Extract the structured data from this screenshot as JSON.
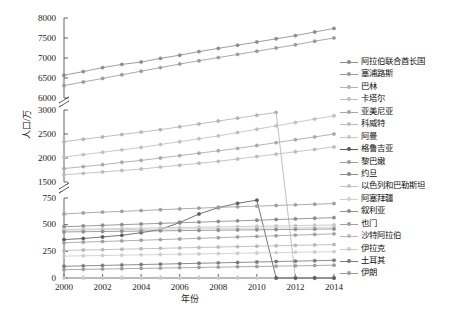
{
  "chart_data": {
    "type": "line",
    "title": "",
    "xlabel": "年份",
    "ylabel": "人口/万",
    "x": [
      2000,
      2001,
      2002,
      2003,
      2004,
      2005,
      2006,
      2007,
      2008,
      2009,
      2010,
      2011,
      2012,
      2013,
      2014
    ],
    "x_tick_labels": [
      "2000",
      "2002",
      "2004",
      "2006",
      "2008",
      "2010",
      "2012",
      "2014"
    ],
    "y_tick_labels": [
      "8000",
      "7500",
      "7000",
      "6500",
      "6000",
      "3000",
      "2500",
      "2000",
      "1500",
      "750",
      "500",
      "250",
      "0"
    ],
    "y_axis_breaks": [
      6000,
      1500
    ],
    "grid": false,
    "legend_position": "right",
    "series": [
      {
        "name": "阿拉伯联合酋长国",
        "color": "#8c8c8c",
        "values": [
          6570,
          6660,
          6760,
          6840,
          6900,
          6990,
          7070,
          7160,
          7240,
          7320,
          7400,
          7480,
          7560,
          7650,
          7740
        ]
      },
      {
        "name": "塞浦路斯",
        "color": "#9a9a9a",
        "values": [
          6310,
          6400,
          6490,
          6580,
          6670,
          6760,
          6850,
          6930,
          7010,
          7090,
          7170,
          7250,
          7330,
          7420,
          7500
        ]
      },
      {
        "name": "巴林",
        "color": "#b4b4b4",
        "values": [
          2340,
          2390,
          2440,
          2490,
          2540,
          2590,
          2650,
          2710,
          2770,
          2830,
          2890,
          2950,
          3010,
          3070,
          3140
        ]
      },
      {
        "name": "卡塔尔",
        "color": "#c0c0c0",
        "values": [
          2020,
          2070,
          2120,
          2170,
          2220,
          2280,
          2340,
          2400,
          2460,
          2530,
          2600,
          2670,
          2740,
          2810,
          2880
        ]
      },
      {
        "name": "亚美尼亚",
        "color": "#a8a8a8",
        "values": [
          1780,
          1820,
          1860,
          1910,
          1950,
          2000,
          2050,
          2100,
          2150,
          2200,
          2260,
          2320,
          2380,
          2440,
          2500
        ]
      },
      {
        "name": "科威特",
        "color": "#bcbcbc",
        "values": [
          1650,
          1680,
          1710,
          1740,
          1770,
          1810,
          1850,
          1890,
          1930,
          1980,
          2030,
          2080,
          2130,
          2180,
          2230
        ]
      },
      {
        "name": "阿曼",
        "color": "#c8c8c8",
        "values": [
          800,
          805,
          810,
          815,
          820,
          825,
          830,
          835,
          840,
          845,
          850,
          855,
          860,
          865,
          870
        ]
      },
      {
        "name": "格鲁吉亚",
        "color": "#5a5a5a",
        "values": [
          360,
          370,
          385,
          400,
          425,
          455,
          520,
          600,
          660,
          700,
          730,
          755,
          775,
          790,
          800
        ]
      },
      {
        "name": "黎巴嫩",
        "color": "#9e9e9e",
        "values": [
          600,
          610,
          618,
          625,
          632,
          640,
          648,
          655,
          662,
          668,
          674,
          680,
          686,
          692,
          698
        ]
      },
      {
        "name": "约旦",
        "color": "#8a8a8a",
        "values": [
          480,
          487,
          494,
          500,
          506,
          512,
          518,
          524,
          530,
          536,
          542,
          548,
          554,
          560,
          566
        ]
      },
      {
        "name": "以色列和巴勒斯坦",
        "color": "#c4c4c4",
        "values": [
          455,
          458,
          461,
          464,
          467,
          470,
          473,
          476,
          479,
          482,
          485,
          488,
          491,
          494,
          497
        ]
      },
      {
        "name": "阿塞拜疆",
        "color": "#d0d0d0",
        "values": [
          448,
          450,
          452,
          454,
          456,
          458,
          460,
          462,
          464,
          466,
          468,
          470,
          472,
          474,
          476
        ]
      },
      {
        "name": "叙利亚",
        "color": "#8f8f8f",
        "values": [
          432,
          434,
          436,
          438,
          440,
          442,
          444,
          446,
          448,
          450,
          452,
          454,
          456,
          458,
          460
        ]
      },
      {
        "name": "也门",
        "color": "#a0a0a0",
        "values": [
          330,
          336,
          342,
          348,
          354,
          360,
          366,
          372,
          378,
          384,
          390,
          396,
          402,
          408,
          414
        ]
      },
      {
        "name": "沙特阿拉伯",
        "color": "#b8b8b8",
        "values": [
          258,
          262,
          266,
          270,
          274,
          278,
          282,
          286,
          290,
          294,
          298,
          302,
          306,
          310,
          314
        ]
      },
      {
        "name": "伊拉克",
        "color": "#cccccc",
        "values": [
          205,
          208,
          211,
          214,
          217,
          220,
          223,
          226,
          229,
          232,
          235,
          238,
          241,
          244,
          247
        ]
      },
      {
        "name": "土耳其",
        "color": "#7a7a7a",
        "values": [
          110,
          114,
          118,
          122,
          126,
          130,
          134,
          138,
          142,
          146,
          150,
          154,
          158,
          162,
          166
        ]
      },
      {
        "name": "伊朗",
        "color": "#9c9c9c",
        "values": [
          78,
          81,
          84,
          87,
          90,
          93,
          96,
          99,
          102,
          105,
          108,
          111,
          114,
          117,
          120
        ]
      }
    ]
  },
  "axes": {
    "y_title": "人口/万",
    "x_title": "年份"
  }
}
